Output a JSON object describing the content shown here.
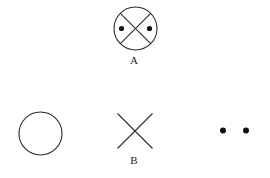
{
  "figure": {
    "background_color": "#ffffff",
    "stroke_color": "#2b2b2b",
    "dot_color": "#111111",
    "stroke_width": 1.1,
    "labels": {
      "a": "A",
      "b": "B"
    },
    "shapes": [
      {
        "name": "circled-x-with-dots",
        "type": "group",
        "label": "A",
        "circle": {
          "cx": 135.5,
          "cy": 28.5,
          "r": 21.5
        },
        "cross": [
          {
            "x1": 120.3,
            "y1": 13.3,
            "x2": 150.7,
            "y2": 43.7
          },
          {
            "x1": 150.7,
            "y1": 13.3,
            "x2": 120.3,
            "y2": 43.7
          }
        ],
        "dots": [
          {
            "cx": 121.5,
            "cy": 28.5,
            "r": 2.6
          },
          {
            "cx": 149.5,
            "cy": 28.5,
            "r": 2.6
          }
        ]
      },
      {
        "name": "empty-circle",
        "type": "circle",
        "label": "",
        "circle": {
          "cx": 40.5,
          "cy": 133.5,
          "r": 21.5
        }
      },
      {
        "name": "cross-x",
        "type": "cross",
        "label": "B",
        "cross": [
          {
            "x1": 117.5,
            "y1": 113.5,
            "x2": 152.5,
            "y2": 148.5
          },
          {
            "x1": 152.5,
            "y1": 113.5,
            "x2": 117.5,
            "y2": 148.5
          }
        ]
      },
      {
        "name": "dot-pair",
        "type": "dots",
        "label": "",
        "dots": [
          {
            "cx": 223.0,
            "cy": 130.5,
            "r": 3.0
          },
          {
            "cx": 246.0,
            "cy": 130.5,
            "r": 3.0
          }
        ]
      }
    ]
  }
}
